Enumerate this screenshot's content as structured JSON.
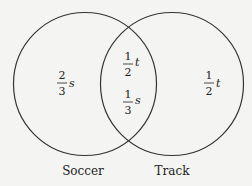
{
  "diagram": {
    "type": "venn",
    "sets": [
      {
        "name": "Soccer",
        "label": "Soccer"
      },
      {
        "name": "Track",
        "label": "Track"
      }
    ],
    "regions": {
      "soccer_only": {
        "numerator": "2",
        "denominator": "3",
        "variable": "s"
      },
      "intersection_top": {
        "numerator": "1",
        "denominator": "2",
        "variable": "t"
      },
      "intersection_bottom": {
        "numerator": "1",
        "denominator": "3",
        "variable": "s"
      },
      "track_only": {
        "numerator": "1",
        "denominator": "2",
        "variable": "t"
      }
    }
  }
}
